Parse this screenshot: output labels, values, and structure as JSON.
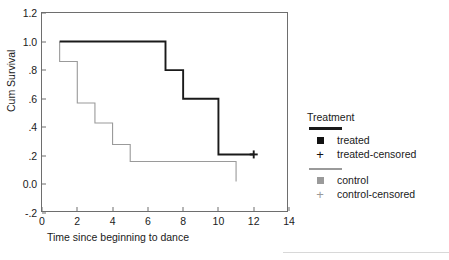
{
  "chart_data": {
    "type": "line",
    "title": "",
    "subtitle": "",
    "xlabel": "Time since beginning to dance",
    "ylabel": "Cum Survival",
    "xlim": [
      0,
      14
    ],
    "ylim": [
      -0.2,
      1.2
    ],
    "xticks": [
      0,
      2,
      4,
      6,
      8,
      10,
      12,
      14
    ],
    "xticklabels": [
      "0",
      "2",
      "4",
      "6",
      "8",
      "10",
      "12",
      "14"
    ],
    "yticks": [
      -0.2,
      0.0,
      0.2,
      0.4,
      0.6,
      0.8,
      1.0,
      1.2
    ],
    "yticklabels": [
      "-.2",
      "0.0",
      ".2",
      ".4",
      ".6",
      ".8",
      "1.0",
      "1.2"
    ],
    "grid": false,
    "legend_position": "right",
    "series": [
      {
        "name": "treated",
        "style": "step",
        "color": "#1a1a1a",
        "linewidth": 2,
        "x": [
          1,
          7,
          7,
          8,
          8,
          10,
          10,
          12
        ],
        "y": [
          1.0,
          1.0,
          0.8,
          0.8,
          0.6,
          0.6,
          0.21,
          0.21
        ],
        "steps": [
          {
            "time": 1,
            "survival": 1.0
          },
          {
            "time": 7,
            "survival": 0.8
          },
          {
            "time": 8,
            "survival": 0.6
          },
          {
            "time": 10,
            "survival": 0.21
          }
        ],
        "censored_points": [
          {
            "time": 12,
            "survival": 0.21
          }
        ]
      },
      {
        "name": "control",
        "style": "step",
        "color": "#9a9a9a",
        "linewidth": 1,
        "x": [
          1,
          1,
          2,
          2,
          3,
          3,
          4,
          4,
          5,
          5,
          11,
          11
        ],
        "y": [
          1.0,
          0.86,
          0.86,
          0.57,
          0.57,
          0.43,
          0.43,
          0.28,
          0.28,
          0.16,
          0.16,
          0.02
        ],
        "steps": [
          {
            "time": 1,
            "survival": 0.86
          },
          {
            "time": 2,
            "survival": 0.57
          },
          {
            "time": 3,
            "survival": 0.43
          },
          {
            "time": 4,
            "survival": 0.28
          },
          {
            "time": 5,
            "survival": 0.16
          },
          {
            "time": 11,
            "survival": 0.02
          }
        ],
        "censored_points": []
      }
    ],
    "legend": {
      "title": "Treatment",
      "entries": [
        {
          "label": "treated",
          "symbol": "filled-square",
          "color": "#111111"
        },
        {
          "label": "treated-censored",
          "symbol": "plus",
          "color": "#111111"
        },
        {
          "label": "control",
          "symbol": "filled-square",
          "color": "#9a9a9a"
        },
        {
          "label": "control-censored",
          "symbol": "plus",
          "color": "#9a9a9a"
        }
      ]
    }
  },
  "axes": {
    "ylabel": "Cum Survival",
    "xlabel": "Time since beginning to dance",
    "yticklabels": [
      "1.2",
      "1.0",
      ".8",
      ".6",
      ".4",
      ".2",
      "0.0",
      "-.2"
    ],
    "xticklabels": [
      "0",
      "2",
      "4",
      "6",
      "8",
      "10",
      "12",
      "14"
    ]
  },
  "legend": {
    "title": "Treatment",
    "rows": [
      {
        "label": "treated"
      },
      {
        "label": "treated-censored"
      },
      {
        "label": "control"
      },
      {
        "label": "control-censored"
      }
    ]
  }
}
